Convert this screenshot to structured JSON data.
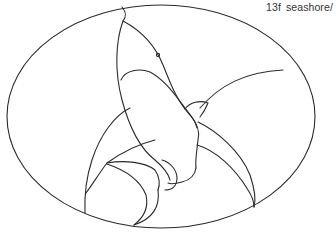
{
  "pattern": {
    "label": "13f  seashore/",
    "subject": "shark leaping over waves in oval frame",
    "line_color": "#2a2a2a",
    "background": "#ffffff"
  }
}
